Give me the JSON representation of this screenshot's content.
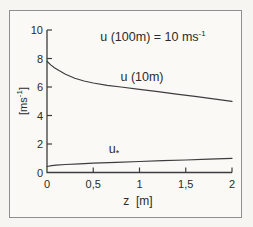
{
  "figure": {
    "background": "#f6f5f2",
    "frame_border_color": "#8f8f8f",
    "line_color": "#3d3d3d",
    "text_color": "#2b2b2b"
  },
  "labels": {
    "title_main": "u (100m) = 10 ms",
    "title_sup": "-1",
    "ylabel_pre": "[ms",
    "ylabel_sup": "-1",
    "ylabel_post": "]",
    "xlabel": "z  [m]",
    "curve_upper": "u (10m)",
    "curve_lower_main": "u",
    "curve_lower_sub": "*"
  },
  "chart_data": {
    "type": "line",
    "xlabel": "z [m]",
    "ylabel": "[ms⁻¹]",
    "xlim": [
      0,
      2
    ],
    "ylim": [
      0,
      10
    ],
    "grid": false,
    "legend_position": "inline-labels",
    "xticks": {
      "values": [
        0,
        0.5,
        1,
        1.5,
        2
      ],
      "labels": [
        "0",
        "0,5",
        "1",
        "1,5",
        "2"
      ]
    },
    "yticks": {
      "values": [
        0,
        2,
        4,
        6,
        8,
        10
      ],
      "labels": [
        "0",
        "2",
        "4",
        "6",
        "8",
        "10"
      ]
    },
    "series": [
      {
        "id": "u-10m",
        "name": "u (10m)",
        "x": [
          0,
          0.04,
          0.08,
          0.13,
          0.2,
          0.3,
          0.4,
          0.5,
          0.65,
          0.8,
          1.0,
          1.2,
          1.4,
          1.6,
          1.8,
          2.0
        ],
        "y": [
          7.8,
          7.55,
          7.35,
          7.15,
          6.9,
          6.62,
          6.42,
          6.28,
          6.12,
          6.0,
          5.84,
          5.68,
          5.5,
          5.34,
          5.17,
          5.0
        ]
      },
      {
        "id": "u-star",
        "name": "u*",
        "x": [
          0,
          0.05,
          0.1,
          0.2,
          0.35,
          0.5,
          0.75,
          1.0,
          1.25,
          1.5,
          1.75,
          2.0
        ],
        "y": [
          0.42,
          0.48,
          0.52,
          0.56,
          0.61,
          0.65,
          0.71,
          0.77,
          0.83,
          0.88,
          0.94,
          1.0
        ]
      }
    ]
  }
}
